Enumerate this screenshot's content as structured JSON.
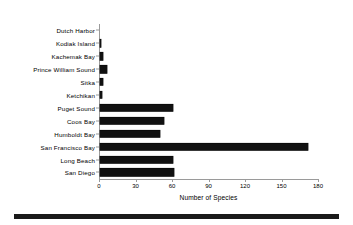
{
  "chart_data": {
    "type": "bar",
    "orientation": "horizontal",
    "title": "",
    "xlabel": "Number of Species",
    "ylabel": "",
    "xlim": [
      0,
      180
    ],
    "xticks": [
      0,
      30,
      60,
      90,
      120,
      150,
      180
    ],
    "xtick_labels": [
      "0",
      "30",
      "60",
      "90",
      "120",
      "150",
      "180"
    ],
    "grid": false,
    "legend": "none",
    "bar_color": "#111111",
    "axis_color": "#9a9a9a",
    "categories": [
      "Dutch Harbor",
      "Kodiak Island",
      "Kachemak Bay",
      "Prince William Sound",
      "Sitka",
      "Ketchikan",
      "Puget Sound",
      "Coos Bay",
      "Humboldt Bay",
      "San Francisco Bay",
      "Long Beach",
      "San Diego"
    ],
    "values": [
      0,
      1,
      3,
      6,
      3,
      2,
      60,
      53,
      50,
      171,
      60,
      61
    ]
  }
}
